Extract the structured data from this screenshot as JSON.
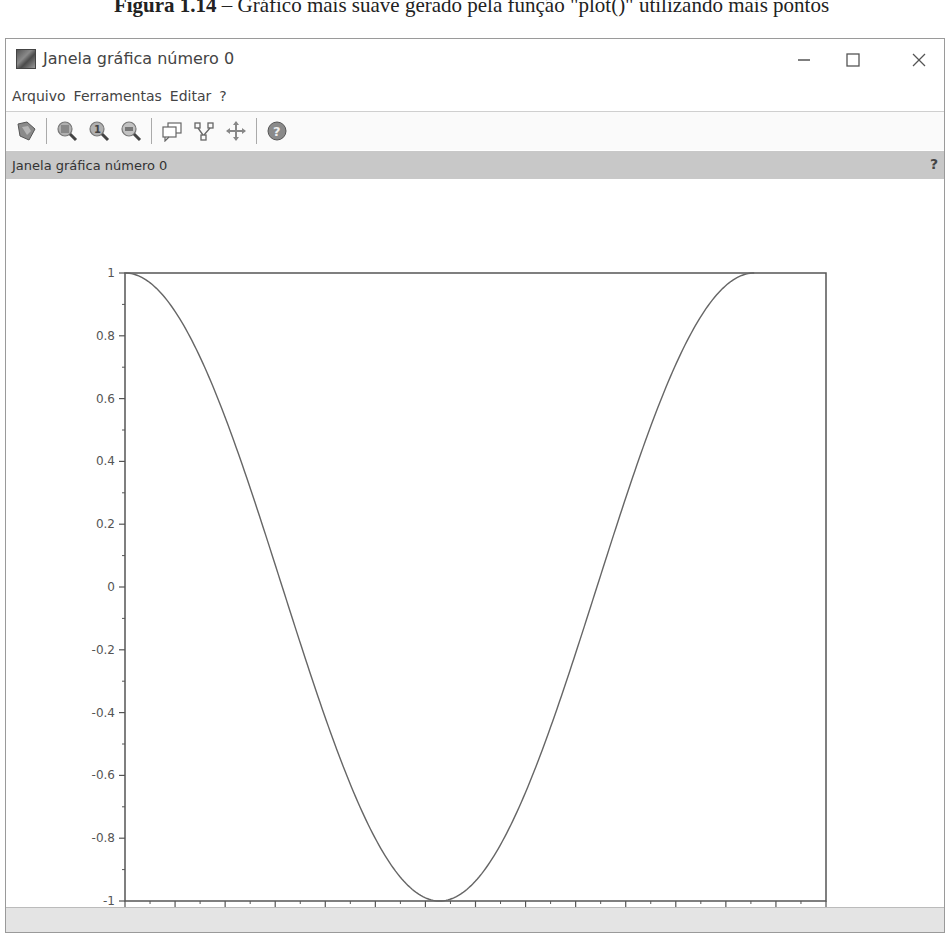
{
  "caption": {
    "label": "Figura 1.14",
    "text": " – Gráfico mais suave gerado pela função \"plot()\" utilizando mais pontos"
  },
  "window": {
    "title": "Janela gráfica número 0",
    "controls": {
      "minimize": "—",
      "maximize": "☐",
      "close": "✕"
    }
  },
  "menubar": {
    "items": [
      {
        "label": "Arquivo"
      },
      {
        "label": "Ferramentas"
      },
      {
        "label": "Editar"
      },
      {
        "label": "?"
      }
    ]
  },
  "toolbar": {
    "buttons": [
      {
        "name": "rotate-icon",
        "tooltip": ""
      },
      {
        "name": "zoom-in-icon",
        "tooltip": ""
      },
      {
        "name": "zoom-original-icon",
        "tooltip": ""
      },
      {
        "name": "zoom-out-icon",
        "tooltip": ""
      },
      {
        "name": "datatip-icon",
        "tooltip": ""
      },
      {
        "name": "editor-icon",
        "tooltip": ""
      },
      {
        "name": "pan-icon",
        "tooltip": ""
      },
      {
        "name": "help-icon",
        "tooltip": ""
      }
    ]
  },
  "strip": {
    "label": "Janela gráfica número 0",
    "help": "?"
  },
  "chart_data": {
    "type": "line",
    "title": "",
    "xlabel": "",
    "ylabel": "",
    "function": "cos(x)",
    "xlim": [
      0,
      7
    ],
    "ylim": [
      -1,
      1
    ],
    "grid": false,
    "legend": null,
    "x_ticks": [
      "0",
      "0.5",
      "1",
      "1.5",
      "2",
      "2.5",
      "3",
      "3.5",
      "4",
      "4.5",
      "5",
      "5.5",
      "6",
      "6.5",
      "7"
    ],
    "y_ticks": [
      "1",
      "0.8",
      "0.6",
      "0.4",
      "0.2",
      "0",
      "-0.2",
      "-0.4",
      "-0.6",
      "-0.8",
      "-1"
    ],
    "series": [
      {
        "name": "cos(x)",
        "color": "#666666",
        "x": [
          0,
          0.5,
          1,
          1.5,
          2,
          2.5,
          3,
          3.1416,
          3.5,
          4,
          4.5,
          5,
          5.5,
          6,
          6.2832
        ],
        "y": [
          1,
          0.878,
          0.54,
          0.071,
          -0.416,
          -0.801,
          -0.99,
          -1,
          -0.936,
          -0.654,
          -0.211,
          0.284,
          0.709,
          0.96,
          1
        ]
      }
    ]
  }
}
